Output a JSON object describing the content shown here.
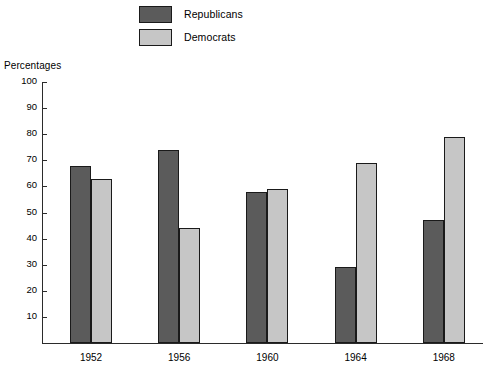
{
  "chart_data": {
    "type": "bar",
    "title": "",
    "subtitle": "",
    "xlabel": "",
    "ylabel": "Percentages",
    "ylim": [
      0,
      100
    ],
    "ytick_labels": [
      "100",
      "90",
      "80",
      "70",
      "60",
      "50",
      "40",
      "30",
      "20",
      "10"
    ],
    "ytick_values": [
      100,
      90,
      80,
      70,
      60,
      50,
      40,
      30,
      20,
      10
    ],
    "grid": false,
    "legend_position": "top-center",
    "categories": [
      "1952",
      "1956",
      "1960",
      "1964",
      "1968"
    ],
    "series": [
      {
        "name": "Republicans",
        "color": "#5b5b5b",
        "values": [
          68,
          74,
          58,
          29,
          47
        ]
      },
      {
        "name": "Democrats",
        "color": "#c6c6c6",
        "values": [
          63,
          44,
          59,
          69,
          79
        ]
      }
    ]
  },
  "legend": {
    "items": [
      {
        "label": "Republicans",
        "color": "#5b5b5b"
      },
      {
        "label": "Democrats",
        "color": "#c6c6c6"
      }
    ]
  },
  "axis": {
    "y_title": "Percentages"
  }
}
